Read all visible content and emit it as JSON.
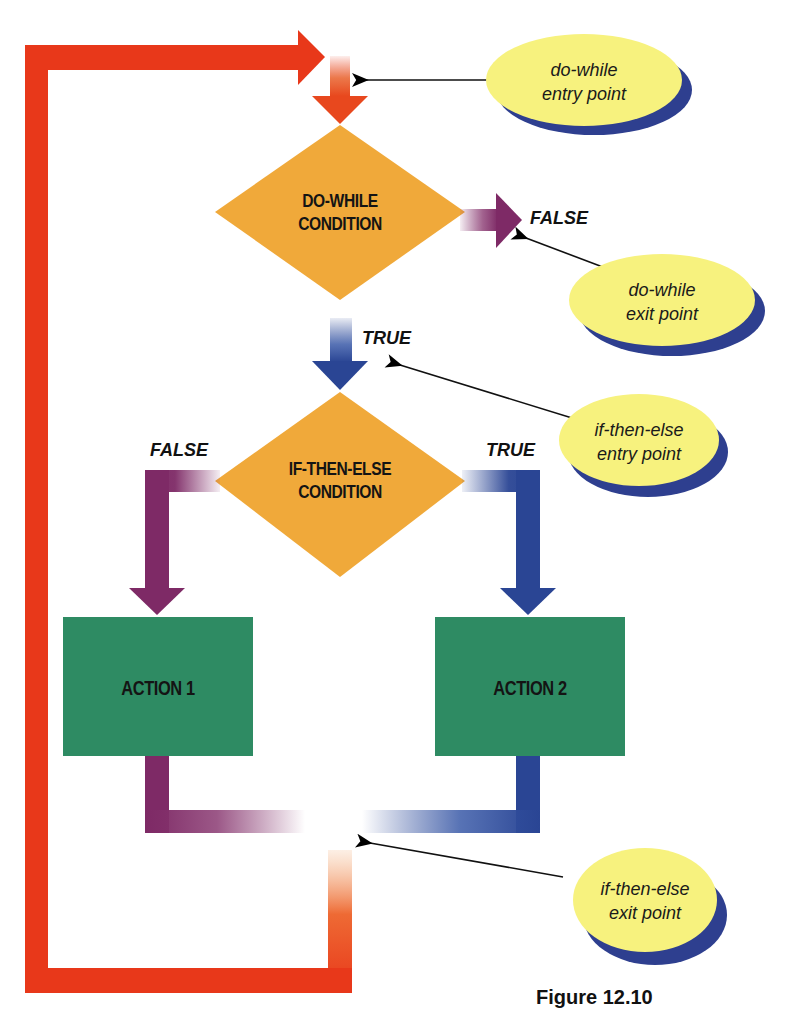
{
  "figure": {
    "caption": "Figure 12.10"
  },
  "nodes": {
    "do_while": {
      "line1": "DO-WHILE",
      "line2": "CONDITION",
      "shape": "diamond",
      "color": "#F0A93A"
    },
    "if_then_else": {
      "line1": "IF-THEN-ELSE",
      "line2": "CONDITION",
      "shape": "diamond",
      "color": "#F0A93A"
    },
    "action1": {
      "label": "ACTION 1",
      "shape": "rectangle",
      "color": "#2E8B63"
    },
    "action2": {
      "label": "ACTION 2",
      "shape": "rectangle",
      "color": "#2E8B63"
    }
  },
  "edge_labels": {
    "do_while_false": "FALSE",
    "do_while_true": "TRUE",
    "if_false": "FALSE",
    "if_true": "TRUE"
  },
  "callouts": [
    {
      "line1": "do-while",
      "line2": "entry point"
    },
    {
      "line1": "do-while",
      "line2": "exit point"
    },
    {
      "line1": "if-then-else",
      "line2": "entry point"
    },
    {
      "line1": "if-then-else",
      "line2": "exit point"
    }
  ],
  "colors": {
    "loop": "#E8381A",
    "false_path": "#7E2A66",
    "true_path": "#2A4594",
    "callout_fill": "#F7F27E",
    "callout_shadow": "#2E3F8F",
    "diamond": "#F0A93A",
    "action": "#2E8B63"
  }
}
